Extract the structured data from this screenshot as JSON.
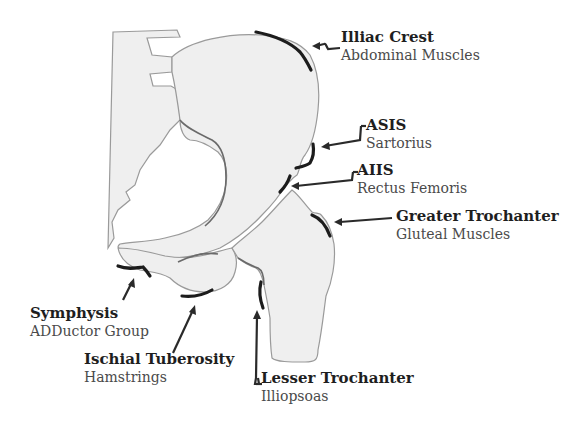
{
  "diagram": {
    "colors": {
      "bone_fill": "#efefef",
      "bone_outline": "#9a9a9a",
      "attachment_mark": "#1c1c1c",
      "arrow": "#2a2a2a",
      "title_text": "#1e1e1e",
      "subtitle_text": "#4a4a4a"
    },
    "labels": [
      {
        "id": "iliac-crest",
        "title": "Illiac Crest",
        "subtitle": "Abdominal Muscles"
      },
      {
        "id": "asis",
        "title": "ASIS",
        "subtitle": "Sartorius"
      },
      {
        "id": "aiis",
        "title": "AIIS",
        "subtitle": "Rectus Femoris"
      },
      {
        "id": "greater-trochanter",
        "title": "Greater Trochanter",
        "subtitle": "Gluteal Muscles"
      },
      {
        "id": "symphysis",
        "title": "Symphysis",
        "subtitle": "ADDuctor Group"
      },
      {
        "id": "ischial-tuberosity",
        "title": "Ischial Tuberosity",
        "subtitle": "Hamstrings"
      },
      {
        "id": "lesser-trochanter",
        "title": "Lesser Trochanter",
        "subtitle": "Illiopsoas"
      }
    ]
  }
}
